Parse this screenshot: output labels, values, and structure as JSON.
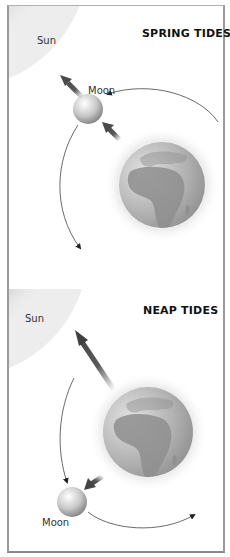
{
  "diagram": {
    "panels": [
      {
        "id": "spring",
        "title": "SPRING TIDES",
        "labels": {
          "sun": "Sun",
          "moon": "Moon"
        }
      },
      {
        "id": "neap",
        "title": "NEAP TIDES",
        "labels": {
          "sun": "Sun",
          "moon": "Moon"
        }
      }
    ],
    "colors": {
      "sun_dark": "#9c9c9c",
      "sun_light": "#ececec",
      "earth": "#a6a6a6",
      "earth_glow": "#f1f1f1",
      "arrow": "#5a5a5a",
      "orbit": "#444444",
      "border": "#9a9a9a"
    }
  }
}
